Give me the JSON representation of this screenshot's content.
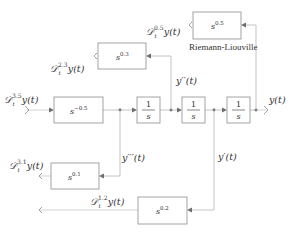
{
  "diagram": {
    "type": "block-diagram",
    "caption": "Riemann-Liouville",
    "blocks": {
      "b_s05": {
        "base": "s",
        "exp": "0.5"
      },
      "b_s03": {
        "base": "s",
        "exp": "0.3"
      },
      "b_sm05": {
        "base": "s",
        "exp": "−0.5"
      },
      "int1": {
        "num": "1",
        "den": "s"
      },
      "int2": {
        "num": "1",
        "den": "s"
      },
      "int3": {
        "num": "1",
        "den": "s"
      },
      "b_s01": {
        "base": "s",
        "exp": "0.1"
      },
      "b_s02": {
        "base": "s",
        "exp": "0.2"
      }
    },
    "signals": {
      "y": "y(t)",
      "y1": "y′(t)",
      "y2": "y′′(t)",
      "y3": "y′′′(t)",
      "d35": {
        "op": "𝒟",
        "sub": "t",
        "sup": "3.5",
        "arg": "y(t)"
      },
      "d23": {
        "op": "𝒟",
        "sub": "t",
        "sup": "2.3",
        "arg": "y(t)"
      },
      "d05": {
        "op": "𝒟",
        "sub": "t",
        "sup": "0.5",
        "arg": "y(t)"
      },
      "d31": {
        "op": "𝒟",
        "sub": "t",
        "sup": "3.1",
        "arg": "y(t)"
      },
      "d12": {
        "op": "𝒟",
        "sub": "t",
        "sup": "1.2",
        "arg": "y(t)"
      }
    }
  }
}
